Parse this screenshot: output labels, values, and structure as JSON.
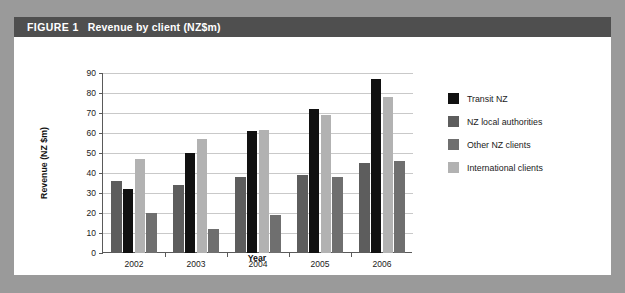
{
  "figure": {
    "label": "FIGURE 1",
    "caption": "Revenue by client (NZ$m)"
  },
  "colors": {
    "page_background": "#9a9a9a",
    "panel_background": "#ffffff",
    "title_bar": "#4f4f4f",
    "title_text": "#ffffff",
    "transit_nz": "#111111",
    "nz_local_authorities": "#5d5d5d",
    "other_nz_clients": "#6f6f6f",
    "international_clients": "#b2b2b2",
    "gridline": "#c9c9c9",
    "axis": "#5a5a5a"
  },
  "chart_data": {
    "type": "bar",
    "title": "Revenue by client (NZ$m)",
    "xlabel": "Year",
    "ylabel": "Revenue (NZ $m)",
    "categories": [
      "2002",
      "2003",
      "2004",
      "2005",
      "2006"
    ],
    "ylim": [
      0,
      90
    ],
    "yticks": [
      0,
      10,
      20,
      30,
      40,
      50,
      60,
      70,
      80,
      90
    ],
    "ytick_labels": [
      "0",
      "10",
      "20",
      "30",
      "40",
      "50",
      "60",
      "70",
      "80",
      "90"
    ],
    "grid": true,
    "legend_position": "right",
    "draw_order": [
      "nz_local_authorities",
      "transit_nz",
      "international_clients",
      "other_nz_clients"
    ],
    "series": [
      {
        "key": "transit_nz",
        "name": "Transit NZ",
        "color": "#111111",
        "values": [
          32,
          50,
          61,
          72,
          87
        ]
      },
      {
        "key": "nz_local_authorities",
        "name": "NZ local authorities",
        "color": "#5d5d5d",
        "values": [
          36,
          34,
          38,
          39,
          45
        ]
      },
      {
        "key": "other_nz_clients",
        "name": "Other NZ clients",
        "color": "#6f6f6f",
        "values": [
          20,
          12,
          19,
          38,
          46
        ]
      },
      {
        "key": "international_clients",
        "name": "International clients",
        "color": "#b2b2b2",
        "values": [
          47,
          57,
          61.5,
          69,
          78
        ]
      }
    ]
  }
}
